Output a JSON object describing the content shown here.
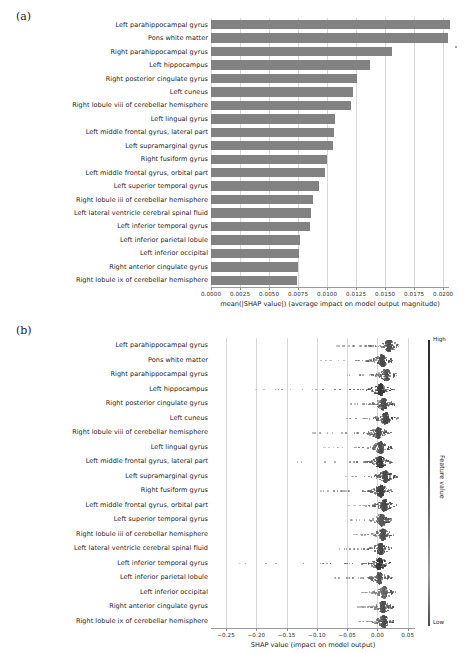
{
  "figure": {
    "panel_a_label": "(a)",
    "panel_b_label": "(b)"
  },
  "features": [
    "Left parahippocampal gyrus",
    "Pons white matter",
    "Right parahippocampal gyrus",
    "Left hippocampus",
    "Right posterior cingulate gyrus",
    "Left cuneus",
    "Right lobule viii of cerebellar hemisphere",
    "Left lingual gyrus",
    "Left middle frontal gyrus, lateral part",
    "Left supramarginal gyrus",
    "Right fusiform gyrus",
    "Left middle frontal gyrus, orbital part",
    "Left superior temporal gyrus",
    "Right lobule iii of cerebellar hemisphere",
    "Left lateral ventricle cerebral spinal fluid",
    "Left inferior temporal gyrus",
    "Left inferior parietal lobule",
    "Left inferior occipital",
    "Right anterior cingulate gyrus",
    "Right lobule ix of cerebellar hemisphere"
  ],
  "chart_data": [
    {
      "type": "bar",
      "panel": "a",
      "orientation": "horizontal",
      "title": "",
      "xlabel": "mean(|SHAP value|) (average impact on model output magnitude)",
      "ylabel": "",
      "xlim": [
        0.0,
        0.0205
      ],
      "xticks": [
        0.0,
        0.0025,
        0.005,
        0.0075,
        0.01,
        0.0125,
        0.015,
        0.0175,
        0.02
      ],
      "xticklabels": [
        "0.0000",
        "0.0025",
        "0.0050",
        "0.0075",
        "0.0100",
        "0.0125",
        "0.0150",
        "0.0175",
        "0.0200"
      ],
      "grid": true,
      "bar_color": "#828282",
      "categories": [
        "Left parahippocampal gyrus",
        "Pons white matter",
        "Right parahippocampal gyrus",
        "Left hippocampus",
        "Right posterior cingulate gyrus",
        "Left cuneus",
        "Right lobule viii of cerebellar hemisphere",
        "Left lingual gyrus",
        "Left middle frontal gyrus, lateral part",
        "Left supramarginal gyrus",
        "Right fusiform gyrus",
        "Left middle frontal gyrus, orbital part",
        "Left superior temporal gyrus",
        "Right lobule iii of cerebellar hemisphere",
        "Left lateral ventricle cerebral spinal fluid",
        "Left inferior temporal gyrus",
        "Left inferior parietal lobule",
        "Left inferior occipital",
        "Right anterior cingulate gyrus",
        "Right lobule ix of cerebellar hemisphere"
      ],
      "values": [
        0.0206,
        0.0204,
        0.0156,
        0.0137,
        0.0126,
        0.0122,
        0.0121,
        0.0107,
        0.0106,
        0.0105,
        0.01,
        0.0098,
        0.0093,
        0.0088,
        0.0086,
        0.0085,
        0.0077,
        0.0076,
        0.0075,
        0.0074
      ]
    },
    {
      "type": "scatter",
      "subtype": "beeswarm",
      "panel": "b",
      "title": "",
      "xlabel": "SHAP value (impact on model output)",
      "ylabel": "",
      "xlim": [
        -0.275,
        0.062
      ],
      "xticks": [
        -0.25,
        -0.2,
        -0.15,
        -0.1,
        -0.05,
        0.0,
        0.05
      ],
      "xticklabels": [
        "−0.25",
        "−0.20",
        "−0.15",
        "−0.10",
        "−0.05",
        "0.00",
        "0.05"
      ],
      "grid": true,
      "colorbar": {
        "title": "Feature value",
        "high_label": "High",
        "low_label": "Low",
        "high_color": "#2d2d2d",
        "low_color": "#9e9e9e"
      },
      "rows": [
        {
          "feature": "Left parahippocampal gyrus",
          "min": -0.072,
          "max": 0.06,
          "dense_center": 0.018,
          "tail": "left"
        },
        {
          "feature": "Pons white matter",
          "min": -0.097,
          "max": 0.048,
          "dense_center": 0.006,
          "tail": "left"
        },
        {
          "feature": "Right parahippocampal gyrus",
          "min": -0.055,
          "max": 0.057,
          "dense_center": 0.014,
          "tail": "left"
        },
        {
          "feature": "Left hippocampus",
          "min": -0.205,
          "max": 0.03,
          "dense_center": 0.004,
          "tail": "left"
        },
        {
          "feature": "Right posterior cingulate gyrus",
          "min": -0.048,
          "max": 0.038,
          "dense_center": 0.009,
          "tail": "left"
        },
        {
          "feature": "Left cuneus",
          "min": -0.062,
          "max": 0.04,
          "dense_center": 0.012,
          "tail": "left"
        },
        {
          "feature": "Right lobule viii of cerebellar hemisphere",
          "min": -0.108,
          "max": 0.049,
          "dense_center": 0.0,
          "tail": "left"
        },
        {
          "feature": "Left lingual gyrus",
          "min": -0.09,
          "max": 0.048,
          "dense_center": 0.004,
          "tail": "left"
        },
        {
          "feature": "Left middle frontal gyrus, lateral part",
          "min": -0.152,
          "max": 0.031,
          "dense_center": 0.003,
          "tail": "left"
        },
        {
          "feature": "Left supramarginal gyrus",
          "min": -0.055,
          "max": 0.038,
          "dense_center": 0.012,
          "tail": "left"
        },
        {
          "feature": "Right fusiform gyrus",
          "min": -0.1,
          "max": 0.03,
          "dense_center": 0.004,
          "tail": "left"
        },
        {
          "feature": "Left middle frontal gyrus, orbital part",
          "min": -0.05,
          "max": 0.032,
          "dense_center": 0.01,
          "tail": "left"
        },
        {
          "feature": "Left superior temporal gyrus",
          "min": -0.048,
          "max": 0.04,
          "dense_center": 0.006,
          "tail": "left"
        },
        {
          "feature": "Right lobule iii of cerebellar hemisphere",
          "min": -0.04,
          "max": 0.034,
          "dense_center": 0.008,
          "tail": "left"
        },
        {
          "feature": "Left lateral ventricle cerebral spinal fluid",
          "min": -0.068,
          "max": 0.03,
          "dense_center": 0.004,
          "tail": "left"
        },
        {
          "feature": "Left inferior temporal gyrus",
          "min": -0.262,
          "max": 0.028,
          "dense_center": 0.002,
          "tail": "left"
        },
        {
          "feature": "Left inferior parietal lobule",
          "min": -0.072,
          "max": 0.045,
          "dense_center": 0.002,
          "tail": "left"
        },
        {
          "feature": "Left inferior occipital",
          "min": -0.028,
          "max": 0.05,
          "dense_center": 0.01,
          "tail": "left"
        },
        {
          "feature": "Right anterior cingulate gyrus",
          "min": -0.037,
          "max": 0.032,
          "dense_center": 0.008,
          "tail": "left"
        },
        {
          "feature": "Right lobule ix of cerebellar hemisphere",
          "min": -0.033,
          "max": 0.028,
          "dense_center": 0.009,
          "tail": "left"
        }
      ]
    }
  ]
}
